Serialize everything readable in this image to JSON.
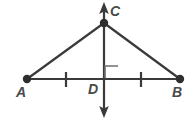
{
  "diagram": {
    "type": "geometry-figure",
    "background_color": "#ffffff",
    "stroke_color": "#3a3a3a",
    "label_color": "#4a4a4a",
    "points": [
      {
        "id": "A",
        "label": "A",
        "x": 27,
        "y": 79,
        "has_dot": true
      },
      {
        "id": "B",
        "label": "B",
        "x": 180,
        "y": 79,
        "has_dot": true
      },
      {
        "id": "C",
        "label": "C",
        "x": 104,
        "y": 23,
        "has_dot": true
      },
      {
        "id": "D",
        "label": "D",
        "x": 104,
        "y": 79,
        "has_dot": false
      }
    ],
    "segments": [
      {
        "id": "AC",
        "from": "A",
        "to": "C"
      },
      {
        "id": "CB",
        "from": "C",
        "to": "B"
      },
      {
        "id": "AB",
        "from": "A",
        "to": "B"
      }
    ],
    "lines": [
      {
        "id": "CD-line",
        "description": "vertical double-headed arrow line through C and D",
        "x": 104,
        "y_top": 3,
        "y_bottom": 117,
        "arrow_top": true,
        "arrow_bottom": true
      }
    ],
    "tick_marks": [
      {
        "id": "tick-AD",
        "on_segment": "AD",
        "x": 66,
        "y": 79,
        "count": 1
      },
      {
        "id": "tick-DB",
        "on_segment": "DB",
        "x": 141,
        "y": 79,
        "count": 1
      }
    ],
    "angle_marks": [
      {
        "id": "right-angle-CDB",
        "kind": "right-angle",
        "at_point": "D",
        "x": 105,
        "y": 66,
        "size": 13
      }
    ]
  },
  "labels": {
    "A": "A",
    "B": "B",
    "C": "C",
    "D": "D"
  }
}
